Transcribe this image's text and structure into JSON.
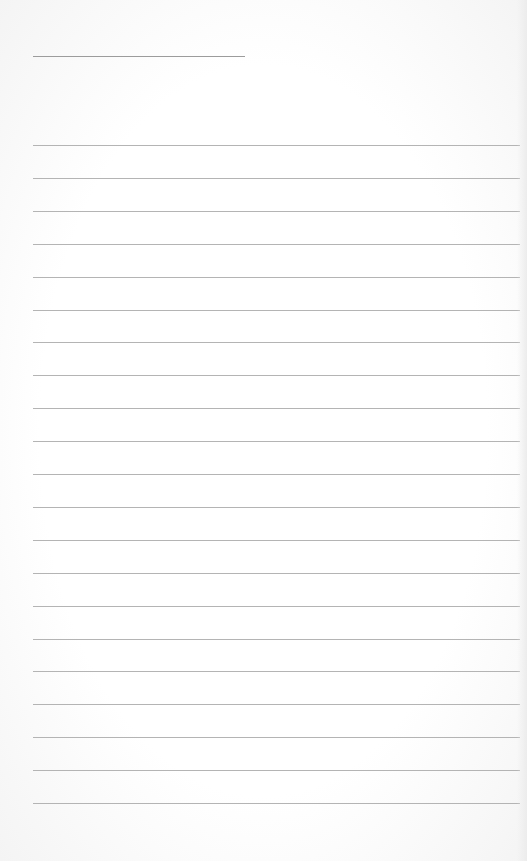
{
  "page": {
    "type": "lined-notepaper",
    "background_color": "#fdfdfd",
    "line_color": "#b4b4b4",
    "header_line": {
      "x": 33,
      "y": 56,
      "width": 212
    },
    "rules": {
      "count": 21,
      "first_y": 145,
      "spacing": 32.9,
      "x": 33,
      "width": 487
    }
  }
}
